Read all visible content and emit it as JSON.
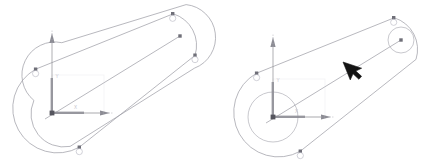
{
  "canvas": {
    "width": 421,
    "height": 168,
    "background": "#ffffff"
  },
  "panels": [
    {
      "id": "panel-left",
      "name": "sketch-before",
      "title": "",
      "origin": {
        "x": 52,
        "y": 113
      },
      "axes": {
        "y_label": "Y",
        "x_label": "X",
        "y_arrow_length": 70,
        "x_arrow_length": 48,
        "x_dotted_extra": 45,
        "corner_box_label": ""
      },
      "slot": {
        "angle_deg": -25,
        "length": 150,
        "half_width": 33,
        "center": {
          "x": 108,
          "y": 79
        }
      },
      "center_line": {
        "x1": 45,
        "y1": 119,
        "x2": 180,
        "y2": 36
      },
      "nodes": [
        {
          "name": "node-top-right",
          "x": 173,
          "y": 14
        },
        {
          "name": "node-right",
          "x": 195,
          "y": 55
        },
        {
          "name": "node-left",
          "x": 35,
          "y": 69
        },
        {
          "name": "node-bottom",
          "x": 79,
          "y": 147
        },
        {
          "name": "node-centerline-end",
          "x": 180,
          "y": 36
        }
      ],
      "circles": [],
      "cursor": null
    },
    {
      "id": "panel-right",
      "name": "sketch-after",
      "title": "",
      "origin": {
        "x": 62,
        "y": 117
      },
      "axes": {
        "y_label": "Y",
        "x_label": "X",
        "y_arrow_length": 70,
        "x_arrow_length": 48,
        "x_dotted_extra": 45,
        "corner_box_label": ""
      },
      "slot": {
        "angle_deg": -25,
        "length": 150,
        "half_width": 33,
        "center": {
          "x": 118,
          "y": 83
        }
      },
      "center_line": {
        "x1": 55,
        "y1": 123,
        "x2": 190,
        "y2": 40
      },
      "nodes": [
        {
          "name": "node-top-right",
          "x": 183,
          "y": 18
        },
        {
          "name": "node-left",
          "x": 45,
          "y": 73
        },
        {
          "name": "node-bottom",
          "x": 89,
          "y": 151
        },
        {
          "name": "node-circle-center",
          "x": 190,
          "y": 40
        }
      ],
      "circles": [
        {
          "name": "origin-circle",
          "cx": 62,
          "cy": 117,
          "r": 25
        },
        {
          "name": "end-circle",
          "cx": 190,
          "cy": 40,
          "r": 13
        }
      ],
      "cursor": {
        "name": "mouse-cursor",
        "x": 138,
        "y": 68,
        "rotation_deg": -25
      }
    }
  ],
  "colors": {
    "outline": "#9a9aa2",
    "axis": "#8c8c94",
    "node": "#6f6f78",
    "node_ring": "#bfbfc8",
    "cursor": "#141414",
    "label": "#c3c3cc"
  }
}
